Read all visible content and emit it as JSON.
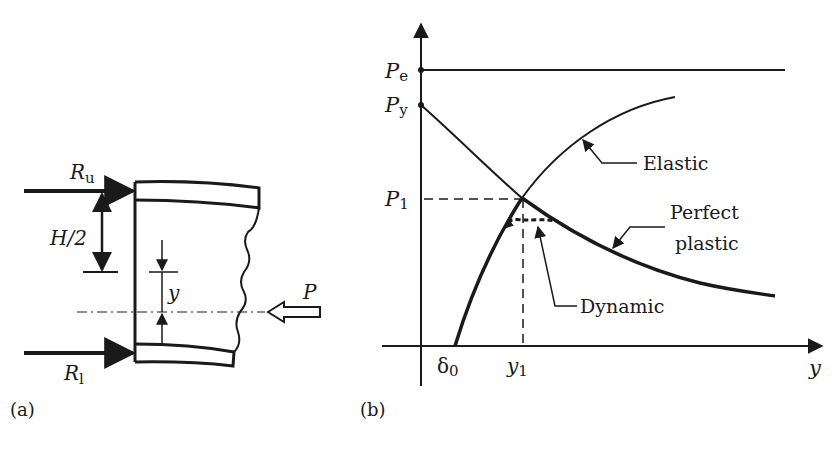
{
  "panel_a": {
    "label": "(a)",
    "forces": {
      "upper_reaction": {
        "symbol": "R",
        "subscript": "u"
      },
      "lower_reaction": {
        "symbol": "R",
        "subscript": "l"
      },
      "axial_load": {
        "symbol": "P"
      }
    },
    "dimensions": {
      "half_height": "H/2",
      "offset": "y"
    }
  },
  "panel_b": {
    "label": "(b)",
    "y_axis_ticks": [
      {
        "symbol": "P",
        "subscript": "e"
      },
      {
        "symbol": "P",
        "subscript": "y"
      },
      {
        "symbol": "P",
        "subscript": "1"
      }
    ],
    "x_axis_ticks": [
      {
        "symbol": "δ",
        "subscript": "0"
      },
      {
        "symbol": "y",
        "subscript": "1"
      }
    ],
    "x_axis_label": "y",
    "curve_labels": {
      "elastic": "Elastic",
      "perfect_plastic_line1": "Perfect",
      "perfect_plastic_line2": "plastic",
      "dynamic": "Dynamic"
    }
  },
  "colors": {
    "ink": "#1a1a1a",
    "background": "#ffffff"
  }
}
